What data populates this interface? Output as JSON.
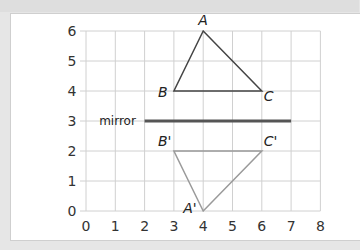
{
  "chart_data": {
    "type": "diagram",
    "title": "",
    "grid": true,
    "xlim": [
      0,
      8
    ],
    "ylim": [
      0,
      6
    ],
    "x_ticks": [
      "0",
      "1",
      "2",
      "3",
      "4",
      "5",
      "6",
      "7",
      "8"
    ],
    "y_ticks": [
      "0",
      "1",
      "2",
      "3",
      "4",
      "5",
      "6"
    ],
    "mirror": {
      "label": "mirror",
      "y": 3,
      "x_from": 2,
      "x_to": 7,
      "color": "#555555"
    },
    "shapes": [
      {
        "name": "original",
        "color": "#444444",
        "points": [
          {
            "label": "A",
            "x": 4,
            "y": 6
          },
          {
            "label": "B",
            "x": 3,
            "y": 4
          },
          {
            "label": "C",
            "x": 6,
            "y": 4
          }
        ]
      },
      {
        "name": "reflection",
        "color": "#9a9a9a",
        "points": [
          {
            "label": "A'",
            "x": 4,
            "y": 0
          },
          {
            "label": "B'",
            "x": 3,
            "y": 2
          },
          {
            "label": "C'",
            "x": 6,
            "y": 2
          }
        ]
      }
    ]
  },
  "labels": {
    "A": "A",
    "B": "B",
    "C": "C",
    "A2": "A'",
    "B2": "B'",
    "C2": "C'",
    "mirror": "mirror"
  }
}
